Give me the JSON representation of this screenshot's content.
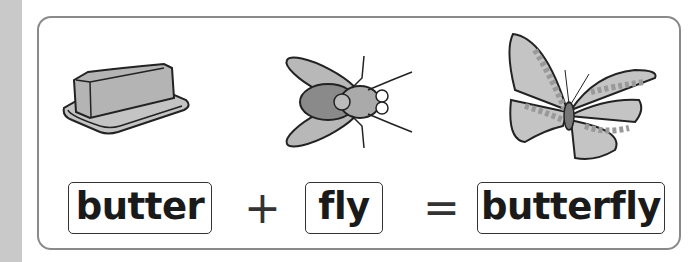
{
  "equation": {
    "terms": [
      {
        "word": "butter",
        "image": "butter-dish-illustration"
      },
      {
        "word": "fly",
        "image": "housefly-illustration"
      },
      {
        "word": "butterfly",
        "image": "butterfly-illustration"
      }
    ],
    "plus": "+",
    "equals": "="
  },
  "colors": {
    "strip": "#c9c9c9",
    "panel_border": "#8a8a8a",
    "text": "#1a1a1a",
    "illustration_fill": "#b8b8b8"
  }
}
